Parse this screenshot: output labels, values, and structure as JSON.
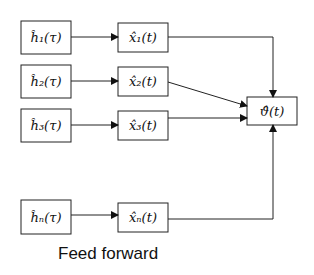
{
  "diagram": {
    "caption": "Feed forward",
    "input_nodes": [
      {
        "label": "ĥ₁(τ)"
      },
      {
        "label": "ĥ₂(τ)"
      },
      {
        "label": "ĥ₃(τ)"
      },
      {
        "label": "ĥₙ(τ)"
      }
    ],
    "estimate_nodes": [
      {
        "label": "x̂₁(t)"
      },
      {
        "label": "x̂₂(t)"
      },
      {
        "label": "x̂₃(t)"
      },
      {
        "label": "x̂ₙ(t)"
      }
    ],
    "output_node": {
      "label": "ϑ̂(t)"
    }
  }
}
